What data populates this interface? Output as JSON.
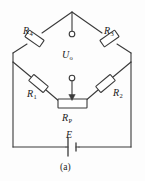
{
  "figure": {
    "caption": "(a)",
    "title_text": "(a)",
    "line_color": "#3a3a3a",
    "background_color": "#fdfdfd",
    "text_color": "#1a1a1a",
    "width": 145,
    "height": 181
  },
  "labels": {
    "r4": {
      "symbol": "R",
      "subscript": "4",
      "name": "resistor-r4"
    },
    "r3": {
      "symbol": "R",
      "subscript": "3",
      "name": "resistor-r3"
    },
    "r1": {
      "symbol": "R",
      "subscript": "1",
      "name": "resistor-r1"
    },
    "r2": {
      "symbol": "R",
      "subscript": "2",
      "name": "resistor-r2"
    },
    "rp": {
      "symbol": "R",
      "subscript": "P",
      "name": "potentiometer-rp"
    },
    "uo": {
      "symbol": "U",
      "subscript": "o",
      "name": "output-voltage"
    },
    "e": {
      "symbol": "E",
      "subscript": "",
      "name": "battery-emf"
    }
  },
  "components": [
    {
      "id": "R4",
      "type": "resistor",
      "label": "R4",
      "orientation": "diagonal-down-left",
      "branch": "top-left"
    },
    {
      "id": "R3",
      "type": "resistor",
      "label": "R3",
      "orientation": "diagonal-down-right",
      "branch": "top-right"
    },
    {
      "id": "R1",
      "type": "resistor",
      "label": "R1",
      "orientation": "diagonal-down-right",
      "branch": "bottom-left"
    },
    {
      "id": "R2",
      "type": "resistor",
      "label": "R2",
      "orientation": "diagonal-down-left",
      "branch": "bottom-right"
    },
    {
      "id": "RP",
      "type": "potentiometer",
      "label": "RP",
      "orientation": "horizontal",
      "branch": "bridge-center"
    },
    {
      "id": "E",
      "type": "battery",
      "label": "E",
      "orientation": "horizontal",
      "branch": "bottom-rail"
    }
  ],
  "terminals": [
    {
      "id": "top-terminal",
      "label": "Uo+",
      "shape": "open-circle"
    },
    {
      "id": "wiper-terminal",
      "label": "Uo-",
      "shape": "open-circle"
    }
  ]
}
